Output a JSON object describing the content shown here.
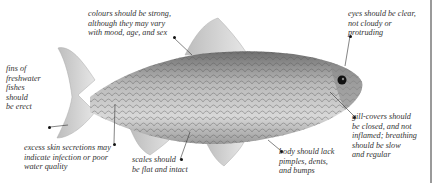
{
  "figure": {
    "annotations": [
      {
        "id": "colours",
        "text": "colours should be strong,\nalthough they may vary\nwith mood, age, and sex"
      },
      {
        "id": "eyes",
        "text": "eyes should be clear,\nnot cloudy or\nprotruding"
      },
      {
        "id": "fins",
        "text": "fins of\nfreshwater\nfishes\nshould\nbe erect"
      },
      {
        "id": "skin",
        "text": "excess skin secretions may\nindicate infection or poor\nwater quality"
      },
      {
        "id": "scales",
        "text": "scales should\nbe flat and intact"
      },
      {
        "id": "body",
        "text": "body should lack\npimples, dents,\nand bumps"
      },
      {
        "id": "gills",
        "text": "gill-covers should\nbe closed, and not\ninflamed; breathing\nshould be slow\nand regular"
      }
    ]
  }
}
